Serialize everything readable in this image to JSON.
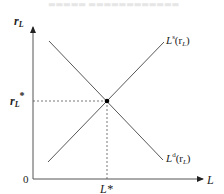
{
  "header": {
    "faint_text": "▬▬▬▬▬  ▬▬▬▬▬▬▬▬▬▬▬▬"
  },
  "diagram": {
    "y_axis_label": "r",
    "y_axis_sub": "L",
    "x_axis_label": "L",
    "origin_label": "0",
    "equilibrium_rate_label": "r",
    "equilibrium_rate_sub": "L",
    "equilibrium_rate_sup": "*",
    "equilibrium_quantity_label": "L*",
    "supply_curve": {
      "main": "L",
      "sup": "s",
      "arg": "(r",
      "arg_sub": "L",
      "close": ")"
    },
    "demand_curve": {
      "main": "L",
      "sup": "d",
      "arg": "(r",
      "arg_sub": "L",
      "close": ")"
    }
  }
}
